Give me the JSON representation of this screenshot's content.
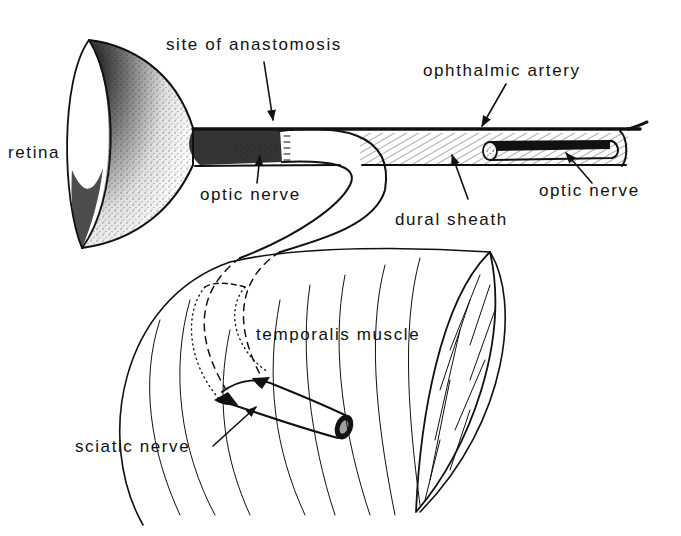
{
  "diagram": {
    "colors": {
      "ink": "#111111",
      "background": "#ffffff",
      "stipple": "#222222"
    },
    "labels": [
      {
        "id": "retina",
        "text": "retina",
        "x": 38,
        "y": 158
      },
      {
        "id": "site-of-anastomosis",
        "text": "site of anastomosis",
        "x": 166,
        "y": 50
      },
      {
        "id": "ophthalmic-artery",
        "text": "ophthalmic artery",
        "x": 423,
        "y": 76
      },
      {
        "id": "optic-nerve-left",
        "text": "optic nerve",
        "x": 200,
        "y": 200
      },
      {
        "id": "dural-sheath",
        "text": "dural sheath",
        "x": 395,
        "y": 225
      },
      {
        "id": "optic-nerve-right",
        "text": "optic nerve",
        "x": 539,
        "y": 196
      },
      {
        "id": "temporalis-muscle",
        "text": "temporalis muscle",
        "x": 256,
        "y": 340
      },
      {
        "id": "sciatic-nerve",
        "text": "sciatic nerve",
        "x": 75,
        "y": 452
      }
    ],
    "arrows": [
      {
        "id": "arrow-anastomosis",
        "x1": 264,
        "y1": 62,
        "x2": 273,
        "y2": 120
      },
      {
        "id": "arrow-ophthalmic-artery",
        "x1": 506,
        "y1": 84,
        "x2": 480,
        "y2": 128
      },
      {
        "id": "arrow-optic-nerve-left",
        "x1": 257,
        "y1": 183,
        "x2": 260,
        "y2": 156
      },
      {
        "id": "arrow-dural-sheath",
        "x1": 468,
        "y1": 199,
        "x2": 452,
        "y2": 153
      },
      {
        "id": "arrow-optic-nerve-right",
        "x1": 592,
        "y1": 183,
        "x2": 566,
        "y2": 152
      },
      {
        "id": "arrow-sciatic-nerve",
        "x1": 213,
        "y1": 446,
        "x2": 258,
        "y2": 405
      }
    ]
  }
}
